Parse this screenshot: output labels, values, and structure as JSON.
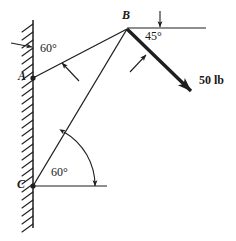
{
  "figure": {
    "type": "statics-free-body-diagram",
    "stroke_color": "#1f1f1f",
    "background_color": "#ffffff",
    "canvas": {
      "width": 236,
      "height": 241
    }
  },
  "wall": {
    "name": "vertical-hatched-wall",
    "x": 33,
    "y_top": 20,
    "y_bottom": 228,
    "hatch_side": "left",
    "hatch_count": 26
  },
  "points": [
    {
      "id": "A",
      "label": "A",
      "x": 33,
      "y": 78,
      "label_x": 18,
      "label_y": 71
    },
    {
      "id": "B",
      "label": "B",
      "x": 127,
      "y": 29,
      "label_x": 122,
      "label_y": 10
    },
    {
      "id": "C",
      "label": "C",
      "x": 33,
      "y": 186,
      "label_x": 17,
      "label_y": 179
    }
  ],
  "members": [
    {
      "name": "member-AB",
      "from": "A",
      "to": "B",
      "x1": 33,
      "y1": 78,
      "x2": 127,
      "y2": 29
    },
    {
      "name": "member-CB",
      "from": "C",
      "to": "B",
      "x1": 33,
      "y1": 186,
      "x2": 127,
      "y2": 29
    }
  ],
  "reference_lines": [
    {
      "name": "horizontal-reference-at-B",
      "x1": 127,
      "y1": 28,
      "x2": 206,
      "y2": 28
    },
    {
      "name": "horizontal-reference-at-C",
      "x1": 33,
      "y1": 186,
      "x2": 107,
      "y2": 186
    }
  ],
  "angles": [
    {
      "id": "angle-at-A",
      "value": "60°",
      "label_x": 40,
      "label_y": 44,
      "at_point": "A",
      "between": "wall and member AB"
    },
    {
      "id": "angle-at-B",
      "value": "45°",
      "label_x": 145,
      "label_y": 31,
      "at_point": "B",
      "between": "horizontal reference and 50 lb force"
    },
    {
      "id": "angle-at-C",
      "value": "60°",
      "label_x": 51,
      "label_y": 167,
      "at_point": "C",
      "between": "horizontal reference and member CB"
    }
  ],
  "force": {
    "name": "applied-load-50lb",
    "label": "50 lb",
    "magnitude": 50,
    "units": "lb",
    "direction_deg_below_horizontal": 45,
    "x1": 127,
    "y1": 29,
    "x2": 196,
    "y2": 96,
    "label_x": 199,
    "label_y": 75
  },
  "indicator_arrows": [
    {
      "name": "wall-indicator-arrow",
      "x1": 12,
      "y1": 43,
      "x2": 33,
      "y2": 47
    },
    {
      "name": "angle-A-indicator-arrow",
      "x1": 78,
      "y1": 80,
      "x2": 62,
      "y2": 63
    },
    {
      "name": "angle-B-indicator-arrow",
      "x1": 131,
      "y1": 71,
      "x2": 145,
      "y2": 56
    },
    {
      "name": "horizontal-B-indicator-arrow",
      "x1": 160,
      "y1": 12,
      "x2": 160,
      "y2": 27
    }
  ],
  "arc_at_C": {
    "name": "angle-arc-60-at-C",
    "center_x": 33,
    "center_y": 186,
    "radius": 62,
    "start_deg": 60,
    "end_deg": 0,
    "double_headed": true
  }
}
